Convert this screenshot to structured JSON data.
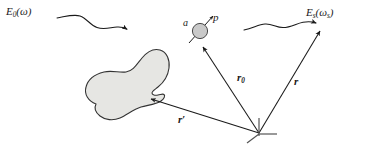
{
  "figure": {
    "background_color": "#ffffff",
    "ink_color": "#1a1a1a",
    "blob_fill_color": "#e6e6e3",
    "particle_fill_color": "#c9c9c9"
  },
  "labels": {
    "incident_field": {
      "symbol": "E",
      "subscript": "0",
      "argument": "(ω)"
    },
    "scattered_field": {
      "symbol": "E",
      "subscript": "s",
      "argument": "(ω",
      "argument_sub": "s",
      "argument_close": ")"
    },
    "polarizability": "a",
    "dipole_moment": "p",
    "vector_r0": {
      "symbol": "r",
      "subscript": "0"
    },
    "vector_r": {
      "symbol": "r"
    },
    "vector_rprime": {
      "symbol": "r",
      "prime": "′"
    }
  },
  "elements": {
    "incident_wave_name": "incident wavy arrow",
    "scattered_wave_name": "scattered wavy arrow",
    "scattering_volume_name": "irregular scattering volume",
    "particle_name": "polarizable particle",
    "origin_name": "coordinate origin marker"
  }
}
